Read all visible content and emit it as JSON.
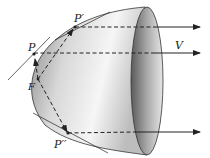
{
  "diagram": {
    "labels": {
      "p": "P",
      "p_prime": "P′",
      "p_double_prime": "P′′",
      "f": "F",
      "v": "V"
    },
    "colors": {
      "stroke": "#222222",
      "shade_dark": "#7a7a7a",
      "shade_light": "#f4f4f4",
      "rim_dark": "#6a6a6a"
    }
  }
}
